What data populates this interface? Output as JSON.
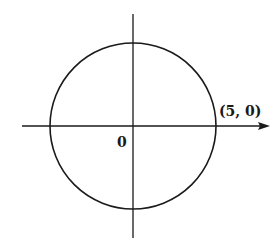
{
  "diagram": {
    "type": "circle-on-axes",
    "labels": {
      "point": "(5, 0)",
      "origin": "0"
    },
    "circle": {
      "center": [
        0,
        0
      ],
      "radius": 5,
      "marked_point": [
        5,
        0
      ]
    },
    "axes": {
      "x_axis_arrow": true,
      "y_axis_arrow": false
    },
    "colors": {
      "stroke": "#1a1a1a",
      "background": "#ffffff"
    }
  }
}
